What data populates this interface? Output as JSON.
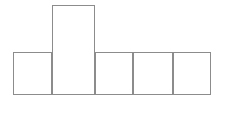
{
  "figure": {
    "type": "geometric-net-diagram",
    "canvas": {
      "width": 226,
      "height": 124,
      "background": "#ffffff"
    },
    "stroke": {
      "color": "#8c8c8c",
      "width": 1.15
    },
    "fill": "#ffffff",
    "face_count": 5,
    "faces": [
      {
        "id": "face-top-flap",
        "name": "tall-upper-rectangle",
        "x": 52,
        "y": 5,
        "width": 43,
        "height": 90,
        "label": ""
      },
      {
        "id": "face-row-1",
        "name": "left-square",
        "x": 13,
        "y": 52,
        "width": 39,
        "height": 43,
        "label": ""
      },
      {
        "id": "face-row-2",
        "name": "second-cell",
        "x": 95,
        "y": 52,
        "width": 38,
        "height": 43,
        "label": ""
      },
      {
        "id": "face-row-3",
        "name": "third-cell",
        "x": 133,
        "y": 52,
        "width": 40,
        "height": 43,
        "label": ""
      },
      {
        "id": "face-row-4",
        "name": "fourth-cell",
        "x": 173,
        "y": 52,
        "width": 38,
        "height": 43,
        "label": ""
      }
    ]
  }
}
